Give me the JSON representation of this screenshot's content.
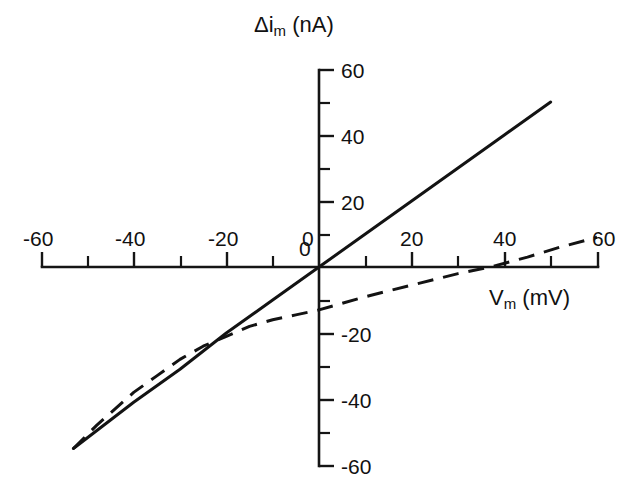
{
  "chart_data": {
    "type": "line",
    "title": "",
    "xlabel": "V_m (mV)",
    "ylabel": "Δi_m (nA)",
    "xlabel_main": "V",
    "xlabel_sub": "m",
    "xlabel_unit": "(mV)",
    "ylabel_main": "Δi",
    "ylabel_sub": "m",
    "ylabel_unit": "(nA)",
    "xlim": [
      -60,
      60
    ],
    "ylim": [
      -60,
      60
    ],
    "x_major_ticks": [
      -60,
      -40,
      -20,
      0,
      20,
      40,
      60
    ],
    "x_minor_ticks": [
      -50,
      -30,
      -10,
      10,
      30,
      50
    ],
    "y_major_ticks": [
      60,
      40,
      20,
      0,
      -20,
      -40,
      -60
    ],
    "y_minor_ticks": [
      50,
      30,
      10,
      -10,
      -30,
      -50
    ],
    "x_tick_labels": [
      "-60",
      "-40",
      "-20",
      "0",
      "20",
      "40",
      "60"
    ],
    "y_tick_labels": [
      "60",
      "40",
      "20",
      "0",
      "-20",
      "-40",
      "-60"
    ],
    "grid": false,
    "legend": "none",
    "axes_style": "crossed-at-origin",
    "line_color": "#131313",
    "series": [
      {
        "name": "linear-control",
        "style": "solid",
        "points": [
          [
            -53,
            -55
          ],
          [
            -40,
            -41
          ],
          [
            -30,
            -31
          ],
          [
            -20,
            -20
          ],
          [
            -10,
            -10
          ],
          [
            0,
            0
          ],
          [
            10,
            10
          ],
          [
            20,
            20
          ],
          [
            30,
            30
          ],
          [
            40,
            40
          ],
          [
            50,
            50
          ]
        ]
      },
      {
        "name": "rectifying-saturating",
        "style": "dashed",
        "points": [
          [
            -53,
            -55
          ],
          [
            -48,
            -48
          ],
          [
            -44,
            -43
          ],
          [
            -40,
            -38
          ],
          [
            -35,
            -33
          ],
          [
            -30,
            -28
          ],
          [
            -25,
            -24
          ],
          [
            -20,
            -21
          ],
          [
            -15,
            -18
          ],
          [
            -10,
            -16
          ],
          [
            -5,
            -14.5
          ],
          [
            0,
            -13
          ],
          [
            10,
            -9
          ],
          [
            20,
            -5.5
          ],
          [
            30,
            -2
          ],
          [
            37,
            0
          ],
          [
            45,
            3
          ],
          [
            52,
            6
          ],
          [
            60,
            9
          ]
        ]
      }
    ]
  }
}
